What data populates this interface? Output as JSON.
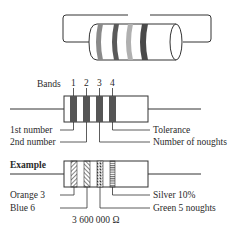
{
  "diagram": {
    "top_resistor": {
      "description": "3D resistor cylinder with four colored bands inside a circuit loop",
      "band_shades": [
        "#8a8a8a",
        "#5a5a5a",
        "#b0b0b0",
        "#4a4a4a"
      ]
    },
    "bands_diagram": {
      "header_label": "Bands",
      "band_numbers": [
        "1",
        "2",
        "3",
        "4"
      ],
      "left_labels": [
        "1st number",
        "2nd number"
      ],
      "right_labels": [
        "Tolerance",
        "Number of noughts"
      ],
      "band_color": "#555555"
    },
    "example_diagram": {
      "heading": "Example",
      "left_labels": [
        "Orange 3",
        "Blue 6"
      ],
      "right_labels": [
        "Silver 10%",
        "Green 5 noughts"
      ],
      "result": "3 600 000 Ω",
      "band_patterns": [
        "diagonal-right",
        "diagonal-left",
        "crosshatch",
        "horizontal"
      ]
    }
  }
}
